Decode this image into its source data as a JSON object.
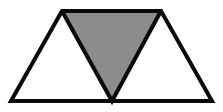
{
  "figure": {
    "name": "triangle-subdivision-figure",
    "canvas": {
      "width": 223,
      "height": 112,
      "background_color": "#FFFFFF"
    },
    "colors": {
      "outline": "#0A0A0A",
      "shaded_fill": "#8C8C8C",
      "unshaded_fill": "#FFFFFF",
      "background": "#FFFFFF"
    },
    "stroke_width": 4,
    "vertices": {
      "bottom_left": [
        11,
        101
      ],
      "bottom_center": [
        112,
        101
      ],
      "bottom_right": [
        212,
        101
      ],
      "left_apex": [
        62,
        11
      ],
      "right_apex": [
        161,
        11
      ]
    },
    "shapes": [
      {
        "id": "left-triangle",
        "label": "Left triangle",
        "fill": "#FFFFFF",
        "shaded": false,
        "orientation": "upward",
        "points": "11,101 62,11 112,101"
      },
      {
        "id": "center-triangle",
        "label": "Center triangle",
        "fill": "#8C8C8C",
        "shaded": true,
        "orientation": "downward",
        "points": "62,11 161,11 112,101"
      },
      {
        "id": "right-triangle",
        "label": "Right triangle",
        "fill": "#FFFFFF",
        "shaded": false,
        "orientation": "upward",
        "points": "112,101 161,11 212,101"
      }
    ],
    "edges": [
      {
        "id": "baseline",
        "label": "Base line",
        "from": [
          11,
          101
        ],
        "to": [
          212,
          101
        ]
      },
      {
        "id": "top-edge",
        "label": "Top edge",
        "from": [
          62,
          11
        ],
        "to": [
          161,
          11
        ]
      },
      {
        "id": "left-outer-edge",
        "label": "Left outer edge",
        "from": [
          11,
          101
        ],
        "to": [
          62,
          11
        ]
      },
      {
        "id": "right-outer-edge",
        "label": "Right outer edge",
        "from": [
          212,
          101
        ],
        "to": [
          161,
          11
        ]
      },
      {
        "id": "left-inner-edge",
        "label": "Left inner edge",
        "from": [
          62,
          11
        ],
        "to": [
          112,
          101
        ]
      },
      {
        "id": "right-inner-edge",
        "label": "Right inner edge",
        "from": [
          161,
          11
        ],
        "to": [
          112,
          101
        ]
      }
    ]
  }
}
